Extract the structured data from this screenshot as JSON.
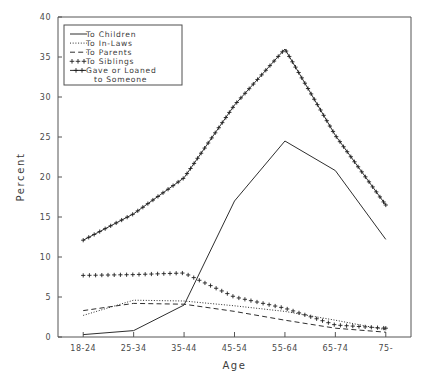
{
  "figure": {
    "top_fragment_text": "",
    "background_color": "#ffffff",
    "ink_color": "#2e2e2e"
  },
  "chart_data": {
    "type": "line",
    "title": "",
    "xlabel": "Age",
    "ylabel": "Percent",
    "categories": [
      "18-24",
      "25-34",
      "35-44",
      "45-54",
      "55-64",
      "65-74",
      "75-"
    ],
    "ylim": [
      0,
      40
    ],
    "ytick_values": [
      0,
      5,
      10,
      15,
      20,
      25,
      30,
      35,
      40
    ],
    "ytick_labels": [
      "0",
      "5",
      "10",
      "15",
      "20",
      "25",
      "30",
      "35",
      "40"
    ],
    "grid": false,
    "legend_position": "upper-left",
    "series": [
      {
        "name": "To Children",
        "style": "solid",
        "marker": "none",
        "values": [
          0.3,
          0.8,
          4.0,
          17.0,
          24.5,
          20.8,
          12.2
        ]
      },
      {
        "name": "To In-Laws",
        "style": "dotted",
        "marker": "none",
        "values": [
          2.7,
          4.6,
          4.5,
          3.9,
          3.2,
          2.1,
          0.9
        ]
      },
      {
        "name": "To Parents",
        "style": "dashed",
        "marker": "none",
        "values": [
          3.3,
          4.2,
          4.1,
          3.2,
          2.1,
          1.1,
          0.6
        ]
      },
      {
        "name": "To Siblings",
        "style": "none",
        "marker": "plus",
        "values": [
          7.7,
          7.8,
          8.0,
          5.0,
          3.6,
          1.5,
          1.1
        ]
      },
      {
        "name": "Gave or Loaned to Someone",
        "style": "solid",
        "marker": "plus",
        "values": [
          12.1,
          15.4,
          19.9,
          29.0,
          36.0,
          25.2,
          16.5
        ]
      }
    ]
  },
  "legend": {
    "entries": [
      {
        "label": "To Children",
        "sample": "solid-line"
      },
      {
        "label": "To In-Laws",
        "sample": "dotted-line"
      },
      {
        "label": "To Parents",
        "sample": "dashed-line"
      },
      {
        "label": "To Siblings",
        "sample": "plus-marks"
      },
      {
        "label": "Gave or Loaned",
        "sample": "solid-line-with-plus"
      },
      {
        "label": "to Someone",
        "sample": "continuation"
      }
    ]
  }
}
